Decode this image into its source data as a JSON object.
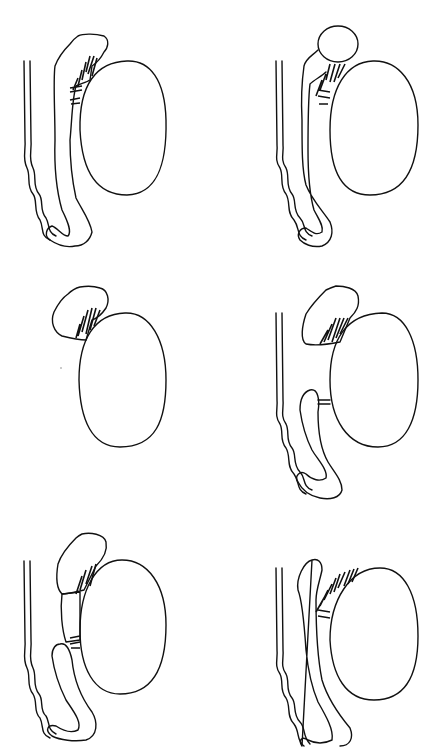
{
  "diagram": {
    "type": "anatomical-line-drawings",
    "layout": {
      "rows": 3,
      "cols": 2
    },
    "background": "#ffffff",
    "stroke_color": "#111111",
    "panels": [
      {
        "id": "p1",
        "row": 1,
        "col": 1,
        "parts": [
          "vas-deferens",
          "epididymis-complete",
          "efferent-ducts",
          "testis"
        ]
      },
      {
        "id": "p2",
        "row": 1,
        "col": 2,
        "parts": [
          "vas-deferens",
          "epididymal-cyst",
          "epididymis-complete",
          "efferent-ducts",
          "testis"
        ]
      },
      {
        "id": "p3",
        "row": 2,
        "col": 1,
        "parts": [
          "epididymis-head-only",
          "efferent-ducts",
          "testis"
        ]
      },
      {
        "id": "p4",
        "row": 2,
        "col": 2,
        "parts": [
          "vas-deferens",
          "epididymis-head",
          "epididymis-body-tail-separated",
          "efferent-ducts",
          "testis"
        ]
      },
      {
        "id": "p5",
        "row": 3,
        "col": 1,
        "parts": [
          "vas-deferens",
          "epididymis-head",
          "epididymis-body-segment",
          "epididymis-tail",
          "efferent-ducts",
          "testis"
        ]
      },
      {
        "id": "p6",
        "row": 3,
        "col": 2,
        "parts": [
          "vas-deferens",
          "epididymis-elongated",
          "efferent-ducts-long",
          "testis"
        ]
      }
    ]
  }
}
